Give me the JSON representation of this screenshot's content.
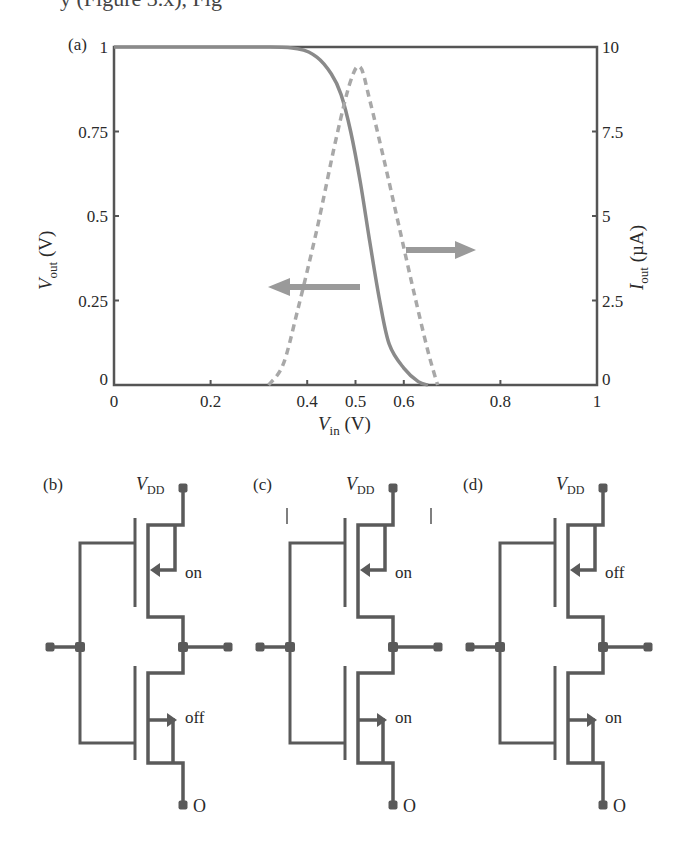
{
  "header": {
    "cropped_text": "y (Figure 3.x), Fig"
  },
  "panel_a": {
    "label": "(a)",
    "xlabel_main": "V",
    "xlabel_sub": "in",
    "xlabel_unit": " (V)",
    "ylabel_left_main": "V",
    "ylabel_left_sub": "out",
    "ylabel_left_unit": " (V)",
    "ylabel_right_main": "I",
    "ylabel_right_sub": "out",
    "ylabel_right_unit": " (µA)",
    "x_ticks": [
      "0",
      "0.2",
      "0.4",
      "0.5",
      "0.6",
      "0.8",
      "1"
    ],
    "y_left_ticks": [
      "0",
      "0.25",
      "0.5",
      "0.75",
      "1"
    ],
    "y_right_ticks": [
      "0",
      "2.5",
      "5",
      "7.5",
      "10"
    ]
  },
  "panel_b": {
    "label": "(b)",
    "vdd_main": "V",
    "vdd_sub": "DD",
    "top_state": "on",
    "bottom_state": "off",
    "ground_label": "O"
  },
  "panel_c": {
    "label": "(c)",
    "vdd_main": "V",
    "vdd_sub": "DD",
    "top_state": "on",
    "bottom_state": "on",
    "ground_label": "O"
  },
  "panel_d": {
    "label": "(d)",
    "vdd_main": "V",
    "vdd_sub": "DD",
    "top_state": "off",
    "bottom_state": "on",
    "ground_label": "O"
  },
  "colors": {
    "curve": "#8a8a8a",
    "dashed": "#a8a8a8",
    "axis": "#555555",
    "arrow": "#9a9a9a",
    "wire": "#5a5a5a"
  },
  "chart_data": {
    "type": "line",
    "title": "",
    "xlabel": "V_in (V)",
    "ylabel": "V_out (V)",
    "ylabel_right": "I_out (µA)",
    "xlim": [
      0,
      1
    ],
    "ylim": [
      0,
      1
    ],
    "ylim_right": [
      0,
      10
    ],
    "x_ticks": [
      0,
      0.2,
      0.4,
      0.5,
      0.6,
      0.8,
      1
    ],
    "grid": false,
    "legend": "arrows indicate axis: solid curve -> left axis, dashed curve -> right axis",
    "series": [
      {
        "name": "V_out",
        "axis": "left",
        "style": "solid",
        "x": [
          0,
          0.3,
          0.38,
          0.42,
          0.45,
          0.47,
          0.49,
          0.51,
          0.53,
          0.55,
          0.57,
          0.6,
          0.63,
          0.65
        ],
        "values": [
          1,
          1,
          0.995,
          0.97,
          0.92,
          0.86,
          0.75,
          0.6,
          0.42,
          0.25,
          0.12,
          0.05,
          0.01,
          0
        ]
      },
      {
        "name": "I_out",
        "axis": "right",
        "style": "dashed",
        "x": [
          0.32,
          0.35,
          0.38,
          0.42,
          0.46,
          0.49,
          0.51,
          0.53,
          0.56,
          0.59,
          0.62,
          0.65,
          0.67
        ],
        "values": [
          0,
          0.6,
          2.2,
          4.6,
          7.3,
          9.0,
          9.4,
          8.4,
          6.6,
          4.7,
          2.8,
          1.0,
          0
        ]
      }
    ]
  }
}
